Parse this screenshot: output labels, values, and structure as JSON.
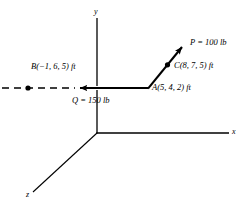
{
  "figure": {
    "background_color": "#ffffff",
    "line_color": "#000000",
    "axes": {
      "y_label": "y",
      "x_label": "x",
      "z_label": "z",
      "origin": {
        "x": 97,
        "y": 133
      }
    },
    "points": [
      {
        "id": "A",
        "label": "A(5, 4, 2) ft",
        "px": 148,
        "py": 88,
        "marker": "none"
      },
      {
        "id": "B",
        "label": "B(−1, 6, 5) ft",
        "px": 28,
        "py": 88,
        "marker": "dot"
      },
      {
        "id": "C",
        "label": "C(8, 7, 5) ft",
        "px": 168,
        "py": 65,
        "marker": "dot"
      }
    ],
    "forces": [
      {
        "id": "P",
        "label": "P = 100 lb",
        "magnitude": 100,
        "unit": "lb",
        "from": {
          "x": 148,
          "y": 88
        },
        "to": {
          "x": 187,
          "y": 42
        },
        "style": "solid"
      },
      {
        "id": "Q",
        "label": "Q = 150 lb",
        "magnitude": 150,
        "unit": "lb",
        "from": {
          "x": 148,
          "y": 88
        },
        "to": {
          "x": 74,
          "y": 88
        },
        "style": "solid-with-dashed-extension"
      }
    ]
  }
}
